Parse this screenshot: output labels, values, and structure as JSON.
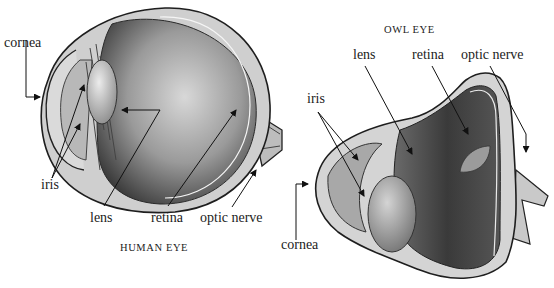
{
  "figure": {
    "panels": [
      {
        "title": "HUMAN EYE",
        "labels": {
          "cornea": "cornea",
          "iris": "iris",
          "lens": "lens",
          "retina": "retina",
          "optic_nerve": "optic nerve"
        }
      },
      {
        "title": "OWL EYE",
        "labels": {
          "cornea": "cornea",
          "iris": "iris",
          "lens": "lens",
          "retina": "retina",
          "optic_nerve": "optic nerve"
        }
      }
    ]
  }
}
